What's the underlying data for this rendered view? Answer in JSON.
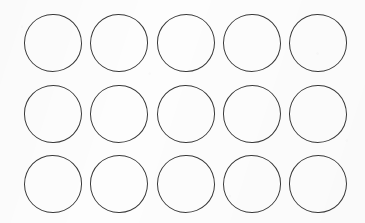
{
  "canvas": {
    "width": 365,
    "height": 223,
    "background_color": "#fdfdfd",
    "description": "scanned sheet with a grid of blank hand-drawn circles"
  },
  "grid": {
    "name": "circle-grid",
    "columns": 5,
    "rows": 3,
    "count": 15,
    "shape": "circle",
    "stroke_color": "#3a3a3a",
    "stroke_width": 1.5,
    "fill_color": "transparent",
    "diameter": 58,
    "column_centers_x": [
      53,
      119,
      186,
      252,
      318
    ],
    "row_centers_y": [
      43,
      114,
      184
    ],
    "column_pitch": 66,
    "row_pitch": 70,
    "circles": [
      {
        "id": "circle-r1-c1",
        "row": 1,
        "col": 1,
        "cx": 53,
        "cy": 43,
        "d": 58,
        "label": ""
      },
      {
        "id": "circle-r1-c2",
        "row": 1,
        "col": 2,
        "cx": 119,
        "cy": 43,
        "d": 58,
        "label": ""
      },
      {
        "id": "circle-r1-c3",
        "row": 1,
        "col": 3,
        "cx": 186,
        "cy": 43,
        "d": 58,
        "label": ""
      },
      {
        "id": "circle-r1-c4",
        "row": 1,
        "col": 4,
        "cx": 252,
        "cy": 43,
        "d": 58,
        "label": ""
      },
      {
        "id": "circle-r1-c5",
        "row": 1,
        "col": 5,
        "cx": 318,
        "cy": 43,
        "d": 58,
        "label": ""
      },
      {
        "id": "circle-r2-c1",
        "row": 2,
        "col": 1,
        "cx": 53,
        "cy": 114,
        "d": 58,
        "label": ""
      },
      {
        "id": "circle-r2-c2",
        "row": 2,
        "col": 2,
        "cx": 119,
        "cy": 114,
        "d": 58,
        "label": ""
      },
      {
        "id": "circle-r2-c3",
        "row": 2,
        "col": 3,
        "cx": 186,
        "cy": 114,
        "d": 58,
        "label": ""
      },
      {
        "id": "circle-r2-c4",
        "row": 2,
        "col": 4,
        "cx": 252,
        "cy": 114,
        "d": 58,
        "label": ""
      },
      {
        "id": "circle-r2-c5",
        "row": 2,
        "col": 5,
        "cx": 318,
        "cy": 114,
        "d": 58,
        "label": ""
      },
      {
        "id": "circle-r3-c1",
        "row": 3,
        "col": 1,
        "cx": 53,
        "cy": 184,
        "d": 58,
        "label": ""
      },
      {
        "id": "circle-r3-c2",
        "row": 3,
        "col": 2,
        "cx": 119,
        "cy": 184,
        "d": 58,
        "label": ""
      },
      {
        "id": "circle-r3-c3",
        "row": 3,
        "col": 3,
        "cx": 186,
        "cy": 184,
        "d": 58,
        "label": ""
      },
      {
        "id": "circle-r3-c4",
        "row": 3,
        "col": 4,
        "cx": 252,
        "cy": 184,
        "d": 58,
        "label": ""
      },
      {
        "id": "circle-r3-c5",
        "row": 3,
        "col": 5,
        "cx": 318,
        "cy": 184,
        "d": 58,
        "label": ""
      }
    ]
  }
}
